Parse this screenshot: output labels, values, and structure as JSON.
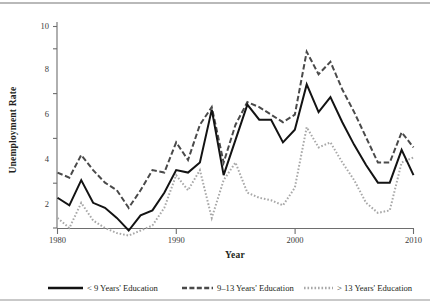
{
  "chart_data": {
    "type": "line",
    "title": "",
    "xlabel": "Year",
    "ylabel": "Unemployment Rate",
    "xlim": [
      1980,
      2010
    ],
    "ylim": [
      1.2,
      10.4
    ],
    "xticks": [
      1980,
      1990,
      2000,
      2010
    ],
    "yticks": [
      2,
      4,
      6,
      8,
      10
    ],
    "grid": false,
    "legend_position": "bottom",
    "x": [
      1980,
      1981,
      1982,
      1983,
      1984,
      1985,
      1986,
      1987,
      1988,
      1989,
      1990,
      1991,
      1992,
      1993,
      1994,
      1995,
      1996,
      1997,
      1998,
      1999,
      2000,
      2001,
      2002,
      2003,
      2004,
      2005,
      2006,
      2007,
      2008,
      2009,
      2010
    ],
    "series": [
      {
        "name": "< 9 Years' Education",
        "style": "solid",
        "color": "#131313",
        "values": [
          3.2,
          2.9,
          3.9,
          3.0,
          2.8,
          2.4,
          1.9,
          2.5,
          2.7,
          3.4,
          4.3,
          4.2,
          4.6,
          6.7,
          4.1,
          5.5,
          6.9,
          6.3,
          6.3,
          5.4,
          5.9,
          7.7,
          6.6,
          7.2,
          6.2,
          5.3,
          4.5,
          3.8,
          3.8,
          5.1,
          4.1
        ]
      },
      {
        "name": "9–13 Years' Education",
        "style": "dashed",
        "color": "#4a4a4a",
        "values": [
          4.2,
          4.0,
          4.9,
          4.3,
          3.8,
          3.5,
          2.8,
          3.5,
          4.3,
          4.2,
          5.4,
          4.7,
          6.1,
          6.8,
          4.6,
          6.1,
          7.0,
          6.8,
          6.5,
          6.2,
          6.5,
          9.0,
          8.1,
          8.6,
          7.5,
          6.6,
          5.6,
          4.6,
          4.6,
          5.8,
          5.2
        ]
      },
      {
        "name": "> 13 Years' Education",
        "style": "dotted",
        "color": "#a8a8a8",
        "values": [
          2.4,
          2.0,
          3.0,
          2.3,
          2.0,
          1.8,
          1.7,
          1.9,
          2.1,
          2.8,
          4.1,
          3.5,
          4.3,
          2.4,
          3.9,
          4.6,
          3.4,
          3.2,
          3.1,
          2.9,
          3.6,
          6.0,
          5.2,
          5.4,
          4.6,
          3.9,
          3.0,
          2.6,
          2.7,
          4.6,
          4.8
        ]
      }
    ]
  },
  "axes": {
    "ylabel": "Unemployment Rate",
    "xlabel": "Year",
    "ytick_labels": [
      "2",
      "4",
      "6",
      "8",
      "10"
    ],
    "xtick_labels": [
      "1980",
      "1990",
      "2000",
      "2010"
    ]
  },
  "legend": {
    "items": [
      {
        "label": "< 9 Years' Education",
        "style": "solid"
      },
      {
        "label": "9–13 Years' Education",
        "style": "dashed"
      },
      {
        "label": "> 13 Years' Education",
        "style": "dotted"
      }
    ]
  }
}
